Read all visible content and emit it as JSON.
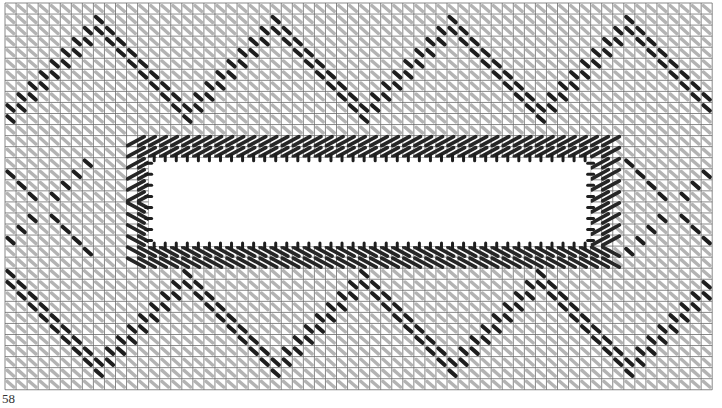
{
  "page": {
    "number": "58"
  },
  "chart": {
    "kind": "needlepoint stitch chart",
    "grid": {
      "origin_x": 5,
      "origin_y": 3,
      "cell": 11.05,
      "cols": 64,
      "rows": 35,
      "line_color": "#6a6a6a"
    },
    "colors": {
      "background_stitch": "#9a9a9a",
      "dark_stitch": "#1e1e1e",
      "frame_stitch": "#262626",
      "opening": "#ffffff"
    },
    "opening": {
      "col0": 13,
      "row0": 14,
      "col1": 53,
      "row1": 22
    },
    "frame": {
      "col0": 11,
      "row0": 12,
      "col1": 55,
      "row1": 24
    }
  }
}
